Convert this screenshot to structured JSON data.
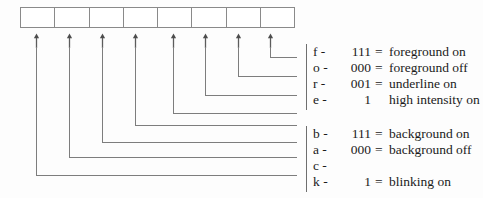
{
  "diagram": {
    "byte": {
      "cell_count": 8,
      "cells": [
        "",
        "",
        "",
        "",
        "",
        "",
        "",
        ""
      ]
    },
    "arrow_count": 8,
    "colors": {
      "line": "#7d7d7d",
      "box_border": "#8a8a8a",
      "text": "#1b1b1b",
      "background": "#fdfdfd"
    },
    "groups": [
      {
        "name": "foreground-group",
        "rows": [
          {
            "key": "f -",
            "code": "111",
            "eq": "=",
            "desc": "foreground on"
          },
          {
            "key": "o -",
            "code": "000",
            "eq": "=",
            "desc": "foreground off"
          },
          {
            "key": "r -",
            "code": "001",
            "eq": "=",
            "desc": "underline on"
          },
          {
            "key": "e -",
            "code": "1",
            "eq": "",
            "desc": "high intensity on"
          }
        ]
      },
      {
        "name": "background-group",
        "rows": [
          {
            "key": "b -",
            "code": "111",
            "eq": "=",
            "desc": "background on"
          },
          {
            "key": "a -",
            "code": "000",
            "eq": "=",
            "desc": "background off"
          },
          {
            "key": "c -",
            "code": "",
            "eq": "",
            "desc": ""
          },
          {
            "key": "k -",
            "code": "1",
            "eq": "=",
            "desc": "blinking on"
          }
        ]
      }
    ]
  }
}
